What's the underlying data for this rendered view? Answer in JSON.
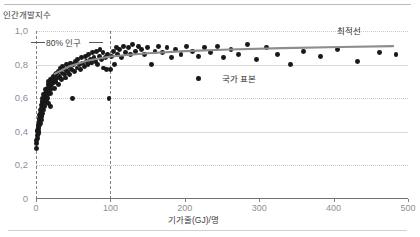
{
  "chart_data": {
    "type": "scatter",
    "title": "",
    "subtitle": "",
    "xlabel": "기가줄(GJ)/명",
    "ylabel": "인간개발지수",
    "xlim": [
      0,
      500
    ],
    "ylim": [
      0,
      1.0
    ],
    "xticks": [
      "0",
      "100",
      "200",
      "300",
      "400",
      "500"
    ],
    "xtick_values": [
      0,
      100,
      200,
      300,
      400,
      500
    ],
    "yticks": [
      "0",
      "0,2",
      "0,4",
      "0,6",
      "0,8",
      "1,0"
    ],
    "ytick_values": [
      0,
      0.2,
      0.4,
      0.6,
      0.8,
      1.0
    ],
    "grid": true,
    "grid_axis": "y",
    "legend_position": "inside-right",
    "annotations": [
      {
        "name": "population-bracket",
        "text": "80% 인구",
        "x_range": [
          0,
          100
        ],
        "y": 0.95,
        "style": "dashed-bracket"
      },
      {
        "name": "trendline-label",
        "text": "최적선",
        "x": 420,
        "y": 0.92
      },
      {
        "name": "country-sample-label",
        "text": "국가 표본",
        "x": 250,
        "y": 0.75,
        "marker": "dot"
      }
    ],
    "reference_lines": [
      {
        "name": "zero-vertical",
        "type": "vertical",
        "x": 0,
        "style": "dashed"
      },
      {
        "name": "eighty-percent-population",
        "type": "vertical",
        "x": 100,
        "style": "dashed"
      }
    ],
    "series": [
      {
        "name": "국가 표본",
        "type": "scatter",
        "marker": "circle",
        "color": "#191919",
        "points": [
          [
            1,
            0.3
          ],
          [
            1,
            0.33
          ],
          [
            1,
            0.35
          ],
          [
            2,
            0.36
          ],
          [
            2,
            0.38
          ],
          [
            2,
            0.4
          ],
          [
            2,
            0.41
          ],
          [
            3,
            0.39
          ],
          [
            3,
            0.42
          ],
          [
            3,
            0.43
          ],
          [
            3,
            0.44
          ],
          [
            4,
            0.4
          ],
          [
            4,
            0.43
          ],
          [
            4,
            0.45
          ],
          [
            4,
            0.47
          ],
          [
            5,
            0.44
          ],
          [
            5,
            0.46
          ],
          [
            5,
            0.48
          ],
          [
            5,
            0.5
          ],
          [
            6,
            0.45
          ],
          [
            6,
            0.49
          ],
          [
            6,
            0.51
          ],
          [
            6,
            0.53
          ],
          [
            7,
            0.47
          ],
          [
            7,
            0.5
          ],
          [
            7,
            0.54
          ],
          [
            7,
            0.56
          ],
          [
            8,
            0.49
          ],
          [
            8,
            0.52
          ],
          [
            8,
            0.55
          ],
          [
            8,
            0.58
          ],
          [
            9,
            0.51
          ],
          [
            9,
            0.54
          ],
          [
            9,
            0.57
          ],
          [
            9,
            0.6
          ],
          [
            10,
            0.53
          ],
          [
            10,
            0.56
          ],
          [
            10,
            0.59
          ],
          [
            10,
            0.62
          ],
          [
            11,
            0.55
          ],
          [
            11,
            0.58
          ],
          [
            11,
            0.61
          ],
          [
            12,
            0.57
          ],
          [
            12,
            0.6
          ],
          [
            12,
            0.63
          ],
          [
            13,
            0.59
          ],
          [
            13,
            0.62
          ],
          [
            13,
            0.65
          ],
          [
            14,
            0.58
          ],
          [
            14,
            0.61
          ],
          [
            14,
            0.64
          ],
          [
            15,
            0.6
          ],
          [
            15,
            0.63
          ],
          [
            15,
            0.66
          ],
          [
            16,
            0.62
          ],
          [
            16,
            0.65
          ],
          [
            16,
            0.68
          ],
          [
            17,
            0.57
          ],
          [
            17,
            0.64
          ],
          [
            17,
            0.7
          ],
          [
            18,
            0.66
          ],
          [
            18,
            0.69
          ],
          [
            19,
            0.63
          ],
          [
            19,
            0.67
          ],
          [
            19,
            0.71
          ],
          [
            20,
            0.55
          ],
          [
            20,
            0.65
          ],
          [
            20,
            0.7
          ],
          [
            21,
            0.68
          ],
          [
            22,
            0.72
          ],
          [
            23,
            0.69
          ],
          [
            24,
            0.73
          ],
          [
            25,
            0.66
          ],
          [
            25,
            0.71
          ],
          [
            26,
            0.74
          ],
          [
            27,
            0.7
          ],
          [
            28,
            0.75
          ],
          [
            29,
            0.72
          ],
          [
            30,
            0.68
          ],
          [
            30,
            0.76
          ],
          [
            32,
            0.73
          ],
          [
            33,
            0.78
          ],
          [
            34,
            0.71
          ],
          [
            35,
            0.75
          ],
          [
            36,
            0.79
          ],
          [
            38,
            0.74
          ],
          [
            39,
            0.77
          ],
          [
            40,
            0.72
          ],
          [
            41,
            0.8
          ],
          [
            42,
            0.76
          ],
          [
            44,
            0.79
          ],
          [
            45,
            0.74
          ],
          [
            46,
            0.81
          ],
          [
            48,
            0.77
          ],
          [
            49,
            0.6
          ],
          [
            50,
            0.8
          ],
          [
            52,
            0.76
          ],
          [
            53,
            0.82
          ],
          [
            55,
            0.78
          ],
          [
            56,
            0.83
          ],
          [
            58,
            0.8
          ],
          [
            60,
            0.77
          ],
          [
            61,
            0.84
          ],
          [
            63,
            0.81
          ],
          [
            65,
            0.79
          ],
          [
            66,
            0.85
          ],
          [
            68,
            0.82
          ],
          [
            70,
            0.8
          ],
          [
            71,
            0.86
          ],
          [
            73,
            0.83
          ],
          [
            75,
            0.81
          ],
          [
            76,
            0.87
          ],
          [
            78,
            0.84
          ],
          [
            80,
            0.82
          ],
          [
            81,
            0.88
          ],
          [
            83,
            0.8
          ],
          [
            85,
            0.85
          ],
          [
            86,
            0.89
          ],
          [
            88,
            0.83
          ],
          [
            90,
            0.87
          ],
          [
            91,
            0.78
          ],
          [
            93,
            0.84
          ],
          [
            95,
            0.77
          ],
          [
            96,
            0.86
          ],
          [
            98,
            0.6
          ],
          [
            100,
            0.77
          ],
          [
            102,
            0.85
          ],
          [
            104,
            0.88
          ],
          [
            106,
            0.8
          ],
          [
            108,
            0.9
          ],
          [
            110,
            0.86
          ],
          [
            112,
            0.89
          ],
          [
            115,
            0.84
          ],
          [
            118,
            0.91
          ],
          [
            120,
            0.87
          ],
          [
            124,
            0.9
          ],
          [
            127,
            0.86
          ],
          [
            130,
            0.92
          ],
          [
            134,
            0.88
          ],
          [
            138,
            0.91
          ],
          [
            142,
            0.89
          ],
          [
            146,
            0.86
          ],
          [
            150,
            0.9
          ],
          [
            155,
            0.8
          ],
          [
            160,
            0.88
          ],
          [
            165,
            0.91
          ],
          [
            170,
            0.87
          ],
          [
            176,
            0.9
          ],
          [
            182,
            0.84
          ],
          [
            188,
            0.89
          ],
          [
            195,
            0.86
          ],
          [
            202,
            0.91
          ],
          [
            210,
            0.88
          ],
          [
            218,
            0.85
          ],
          [
            226,
            0.9
          ],
          [
            235,
            0.87
          ],
          [
            244,
            0.91
          ],
          [
            252,
            0.84
          ],
          [
            262,
            0.89
          ],
          [
            272,
            0.86
          ],
          [
            284,
            0.92
          ],
          [
            296,
            0.83
          ],
          [
            310,
            0.9
          ],
          [
            325,
            0.86
          ],
          [
            342,
            0.8
          ],
          [
            360,
            0.88
          ],
          [
            382,
            0.85
          ],
          [
            405,
            0.89
          ],
          [
            432,
            0.82
          ],
          [
            462,
            0.87
          ],
          [
            484,
            0.86
          ]
        ]
      },
      {
        "name": "최적선",
        "type": "line",
        "color": "#8a8d91",
        "points": [
          [
            0,
            0.6
          ],
          [
            10,
            0.68
          ],
          [
            25,
            0.745
          ],
          [
            45,
            0.79
          ],
          [
            70,
            0.825
          ],
          [
            100,
            0.848
          ],
          [
            150,
            0.868
          ],
          [
            200,
            0.88
          ],
          [
            260,
            0.89
          ],
          [
            330,
            0.898
          ],
          [
            410,
            0.905
          ],
          [
            480,
            0.91
          ]
        ]
      }
    ]
  }
}
